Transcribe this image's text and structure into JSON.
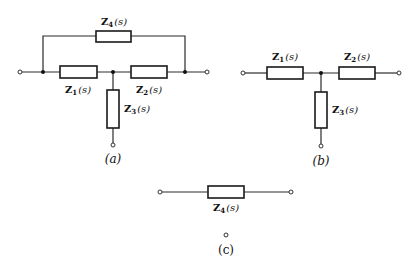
{
  "figure": {
    "panel_a": {
      "caption": "(a)",
      "impedances": [
        {
          "id": "Z4",
          "base": "Z",
          "sub": "4",
          "arg": "(s)",
          "position": "bridge top"
        },
        {
          "id": "Z1",
          "base": "Z",
          "sub": "1",
          "arg": "(s)",
          "position": "series left"
        },
        {
          "id": "Z2",
          "base": "Z",
          "sub": "2",
          "arg": "(s)",
          "position": "series right"
        },
        {
          "id": "Z3",
          "base": "Z",
          "sub": "3",
          "arg": "(s)",
          "position": "shunt"
        }
      ]
    },
    "panel_b": {
      "caption": "(b)",
      "impedances": [
        {
          "id": "Z1",
          "base": "Z",
          "sub": "1",
          "arg": "(s)"
        },
        {
          "id": "Z2",
          "base": "Z",
          "sub": "2",
          "arg": "(s)"
        },
        {
          "id": "Z3",
          "base": "Z",
          "sub": "3",
          "arg": "(s)"
        }
      ]
    },
    "panel_c": {
      "caption": "(c)",
      "impedances": [
        {
          "id": "Z4",
          "base": "Z",
          "sub": "4",
          "arg": "(s)"
        }
      ]
    }
  }
}
